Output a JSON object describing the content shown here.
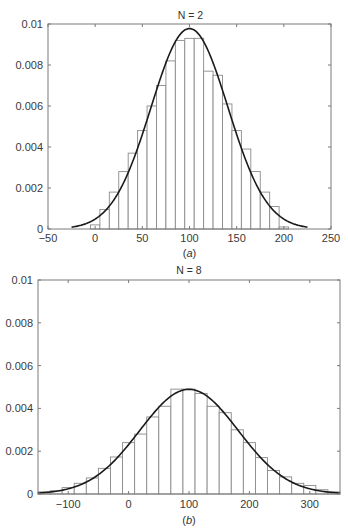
{
  "chart_data": [
    {
      "type": "bar",
      "title": "N = 2",
      "caption": "(a)",
      "xlabel": "",
      "ylabel": "",
      "xlim": [
        -50,
        250
      ],
      "ylim": [
        0,
        0.01
      ],
      "xticks": [
        -50,
        0,
        50,
        100,
        150,
        200,
        250
      ],
      "xtick_labels": [
        "−50",
        "0",
        "50",
        "100",
        "150",
        "200",
        "250"
      ],
      "yticks": [
        0,
        0.002,
        0.004,
        0.006,
        0.008,
        0.01
      ],
      "ytick_labels": [
        "0",
        "0.002",
        "0.004",
        "0.006",
        "0.008",
        "0.01"
      ],
      "grid": false,
      "bar_width": 10,
      "categories": [
        0,
        10,
        20,
        30,
        40,
        50,
        60,
        70,
        80,
        90,
        100,
        110,
        120,
        130,
        140,
        150,
        160,
        170,
        180,
        190,
        200
      ],
      "values": [
        0.0002,
        0.00095,
        0.0018,
        0.0028,
        0.0037,
        0.0048,
        0.006,
        0.007,
        0.0082,
        0.0092,
        0.0093,
        0.0093,
        0.0077,
        0.0075,
        0.0061,
        0.0048,
        0.0039,
        0.0028,
        0.0018,
        0.0011,
        0.0001
      ],
      "curve": {
        "type": "normal_pdf",
        "mean": 100,
        "std": 40.8,
        "x_range": [
          -25,
          225
        ]
      }
    },
    {
      "type": "bar",
      "title": "N = 8",
      "caption": "(b)",
      "xlabel": "",
      "ylabel": "",
      "xlim": [
        -150,
        350
      ],
      "ylim": [
        0,
        0.01
      ],
      "xticks": [
        -100,
        0,
        100,
        200,
        300
      ],
      "xtick_labels": [
        "−100",
        "0",
        "100",
        "200",
        "300"
      ],
      "yticks": [
        0,
        0.002,
        0.004,
        0.006,
        0.008,
        0.01
      ],
      "ytick_labels": [
        "0",
        "0.002",
        "0.004",
        "0.006",
        "0.008",
        "0.01"
      ],
      "grid": false,
      "bar_width": 20,
      "categories": [
        -140,
        -120,
        -100,
        -80,
        -60,
        -40,
        -20,
        0,
        20,
        40,
        60,
        80,
        100,
        120,
        140,
        160,
        180,
        200,
        220,
        240,
        260,
        280,
        300,
        320,
        340
      ],
      "values": [
        0.0001,
        0.00015,
        0.0003,
        0.0005,
        0.00075,
        0.0012,
        0.00173,
        0.0024,
        0.0028,
        0.0036,
        0.0041,
        0.0049,
        0.0049,
        0.0047,
        0.0041,
        0.0038,
        0.003,
        0.0024,
        0.0017,
        0.0011,
        0.0008,
        0.0005,
        0.0004,
        0.0002,
        0.0001
      ],
      "curve": {
        "type": "normal_pdf",
        "mean": 100,
        "std": 81.6,
        "x_range": [
          -150,
          350
        ]
      }
    }
  ]
}
